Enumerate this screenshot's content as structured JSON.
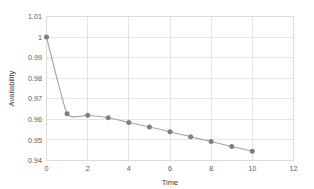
{
  "chart_data": {
    "type": "line",
    "title": "",
    "xlabel": "Time",
    "ylabel": "Availability",
    "xlim": [
      0,
      12
    ],
    "ylim": [
      0.94,
      1.01
    ],
    "xticks": [
      "0",
      "2",
      "4",
      "6",
      "8",
      "10",
      "12"
    ],
    "xtick_values": [
      0,
      2,
      4,
      6,
      8,
      10,
      12
    ],
    "yticks": [
      "0.94",
      "0.95",
      "0.96",
      "0.97",
      "0.98",
      "0.99",
      "1",
      "1.01"
    ],
    "ytick_values": [
      0.94,
      0.95,
      0.96,
      0.97,
      0.98,
      0.99,
      1.0,
      1.01
    ],
    "grid": "horizontal-and-vertical",
    "legend": "none",
    "smoothing": true,
    "x": [
      0,
      1,
      2,
      3,
      4,
      5,
      6,
      7,
      8,
      9,
      10
    ],
    "values": [
      1.0,
      0.9627,
      0.962,
      0.9608,
      0.9585,
      0.9563,
      0.954,
      0.9516,
      0.9492,
      0.9468,
      0.9445
    ],
    "series": [
      {
        "name": "Availability",
        "x": [
          0,
          1,
          2,
          3,
          4,
          5,
          6,
          7,
          8,
          9,
          10
        ],
        "values": [
          1.0,
          0.9627,
          0.962,
          0.9608,
          0.9585,
          0.9563,
          0.954,
          0.9516,
          0.9492,
          0.9468,
          0.9445
        ],
        "line_color": "#a6a6a6",
        "marker_color": "#808080",
        "marker": "circle"
      }
    ],
    "colors": {
      "line": "#a6a6a6",
      "marker": "#808080",
      "grid": "#d9d9d9",
      "border": "#d9d9d9",
      "tick_text": "#595959",
      "axis_title_text": "#404040",
      "background": "#ffffff"
    }
  }
}
